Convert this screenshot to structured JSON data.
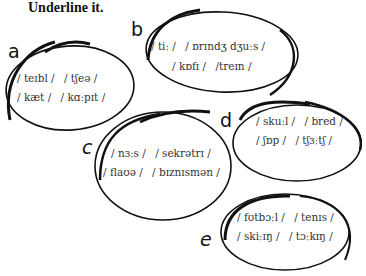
{
  "instruction": "Underline it.",
  "groups": [
    {
      "letter": "a",
      "words": [
        "/ teɪbl /",
        "/ tʃeə /",
        "/ kæt /",
        "/ kɑːpɪt /"
      ]
    },
    {
      "letter": "b",
      "words": [
        "/ tiː /",
        "/ ɒrɪndʒ dʒuːs /",
        "/ kɒfɪ /",
        "/treɪn /"
      ]
    },
    {
      "letter": "c",
      "words": [
        "/ nɜːs /",
        "/ sekrətrɪ /",
        "/ flaʊə /",
        "/ bɪznɪsmən /"
      ]
    },
    {
      "letter": "d",
      "words": [
        "/ skuːl /",
        "/ bred /",
        "/ ʃɒp /",
        "/ tʃɜːtʃ /"
      ]
    },
    {
      "letter": "e",
      "words": [
        "/ fʊtbɔːl /",
        "/ tenɪs /",
        "/ skiːɪŋ /",
        "/ tɔːkɪŋ /"
      ]
    }
  ],
  "colors": {
    "stroke": "#111111",
    "text": "#333333"
  }
}
